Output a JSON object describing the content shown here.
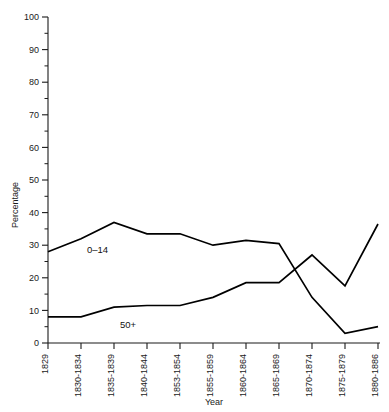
{
  "chart_data": {
    "type": "line",
    "title": "",
    "xlabel": "Year",
    "ylabel": "Percentage",
    "ylim": [
      0,
      100
    ],
    "ytick_step": 10,
    "yminor_step": 5,
    "grid": false,
    "legend_position": "inline-labels",
    "categories": [
      "1829",
      "1830-1834",
      "1835-1839",
      "1840-1844",
      "1853-1854",
      "1855-1859",
      "1860-1864",
      "1865-1869",
      "1870-1874",
      "1875-1879",
      "1880-1886"
    ],
    "yticks": [
      0,
      10,
      20,
      30,
      40,
      50,
      60,
      70,
      80,
      90,
      100
    ],
    "series": [
      {
        "name": "0-14",
        "label": "0–14",
        "values": [
          28,
          32,
          37,
          33.5,
          33.5,
          30,
          31.5,
          30.5,
          14,
          3,
          5
        ]
      },
      {
        "name": "50+",
        "label": "50+",
        "values": [
          8,
          8,
          11,
          11.5,
          11.5,
          14,
          18.5,
          18.5,
          27,
          17.5,
          36.5
        ]
      }
    ],
    "annotations": [
      {
        "text": "0–14",
        "category_index": 1,
        "value": 28.5
      },
      {
        "text": "50+",
        "category_index": 2,
        "value": 5.5
      }
    ]
  }
}
